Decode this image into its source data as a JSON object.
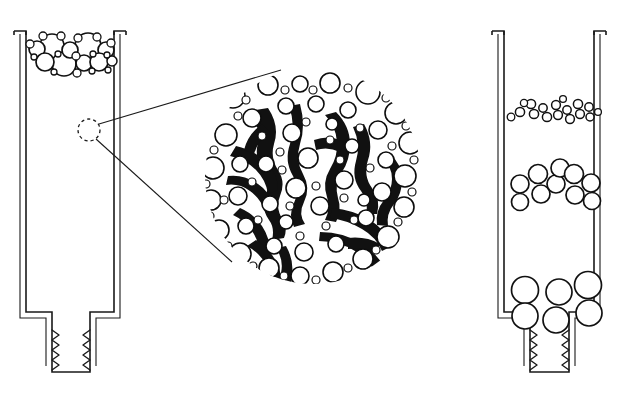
{
  "figure": {
    "background_color": "#ffffff",
    "ink_color": "#111111",
    "width": 621,
    "height": 410
  },
  "panels": [
    {
      "id": "left-tube",
      "name": "left-tube-panel",
      "label": "Left tube with dense mixed-size bubble layer at top",
      "tube": {
        "outer_left": 20,
        "outer_right": 120,
        "top": 30,
        "body_bottom": 312,
        "neck_left": 52,
        "neck_right": 90,
        "neck_bottom": 372,
        "wall_thickness": 6,
        "rim_flare": 9
      },
      "content_band": {
        "name": "mixed-bubble-band",
        "top": 34,
        "bottom": 74,
        "description": "Closely packed large and small circles spanning tube width"
      },
      "bubbles": [
        {
          "cx": 37,
          "cy": 49,
          "r": 8
        },
        {
          "cx": 52,
          "cy": 46,
          "r": 12
        },
        {
          "cx": 70,
          "cy": 50,
          "r": 8
        },
        {
          "cx": 88,
          "cy": 46,
          "r": 13
        },
        {
          "cx": 106,
          "cy": 50,
          "r": 8
        },
        {
          "cx": 45,
          "cy": 62,
          "r": 9
        },
        {
          "cx": 64,
          "cy": 64,
          "r": 12
        },
        {
          "cx": 84,
          "cy": 63,
          "r": 8
        },
        {
          "cx": 99,
          "cy": 62,
          "r": 9
        },
        {
          "cx": 112,
          "cy": 61,
          "r": 5
        },
        {
          "cx": 30,
          "cy": 44,
          "r": 4
        },
        {
          "cx": 43,
          "cy": 36,
          "r": 4
        },
        {
          "cx": 61,
          "cy": 36,
          "r": 4
        },
        {
          "cx": 78,
          "cy": 38,
          "r": 4
        },
        {
          "cx": 97,
          "cy": 37,
          "r": 4
        },
        {
          "cx": 111,
          "cy": 43,
          "r": 4
        },
        {
          "cx": 34,
          "cy": 57,
          "r": 3
        },
        {
          "cx": 58,
          "cy": 54,
          "r": 3
        },
        {
          "cx": 76,
          "cy": 56,
          "r": 4
        },
        {
          "cx": 93,
          "cy": 54,
          "r": 3
        },
        {
          "cx": 107,
          "cy": 55,
          "r": 3
        },
        {
          "cx": 54,
          "cy": 72,
          "r": 3
        },
        {
          "cx": 77,
          "cy": 73,
          "r": 4
        },
        {
          "cx": 92,
          "cy": 71,
          "r": 3
        },
        {
          "cx": 108,
          "cy": 70,
          "r": 3
        }
      ]
    },
    {
      "id": "right-tube",
      "name": "right-tube-panel",
      "label": "Right tube with three separated bubble bands of increasing size downward",
      "tube": {
        "outer_left": 498,
        "outer_right": 600,
        "top": 30,
        "body_bottom": 312,
        "neck_left": 530,
        "neck_right": 569,
        "neck_bottom": 372,
        "wall_thickness": 6,
        "rim_flare": 9
      },
      "bands": [
        {
          "name": "small-bubble-band",
          "top": 98,
          "bottom": 122,
          "size_label": "small",
          "radius": 4.5
        },
        {
          "name": "medium-bubble-band",
          "top": 166,
          "bottom": 204,
          "size_label": "medium",
          "radius": 9
        },
        {
          "name": "large-bubble-band",
          "top": 276,
          "bottom": 318,
          "size_label": "large",
          "radius": 13
        }
      ],
      "small_bubbles": [
        {
          "cx": 520,
          "cy": 112,
          "r": 4.6
        },
        {
          "cx": 531,
          "cy": 104,
          "r": 4.6
        },
        {
          "cx": 534,
          "cy": 114,
          "r": 4.6
        },
        {
          "cx": 543,
          "cy": 108,
          "r": 4.2
        },
        {
          "cx": 547,
          "cy": 117,
          "r": 4.6
        },
        {
          "cx": 556,
          "cy": 105,
          "r": 4.4
        },
        {
          "cx": 558,
          "cy": 115,
          "r": 4.4
        },
        {
          "cx": 567,
          "cy": 110,
          "r": 4.2
        },
        {
          "cx": 570,
          "cy": 119,
          "r": 4.4
        },
        {
          "cx": 578,
          "cy": 104,
          "r": 4.6
        },
        {
          "cx": 580,
          "cy": 114,
          "r": 4.4
        },
        {
          "cx": 589,
          "cy": 107,
          "r": 4.2
        },
        {
          "cx": 590,
          "cy": 117,
          "r": 4.0
        },
        {
          "cx": 511,
          "cy": 117,
          "r": 3.8
        },
        {
          "cx": 524,
          "cy": 103,
          "r": 3.6
        },
        {
          "cx": 563,
          "cy": 99,
          "r": 3.4
        },
        {
          "cx": 598,
          "cy": 112,
          "r": 3.4
        }
      ],
      "medium_bubbles": [
        {
          "cx": 520,
          "cy": 184,
          "r": 9
        },
        {
          "cx": 538,
          "cy": 174,
          "r": 9.5
        },
        {
          "cx": 541,
          "cy": 194,
          "r": 9
        },
        {
          "cx": 556,
          "cy": 184,
          "r": 9
        },
        {
          "cx": 560,
          "cy": 168,
          "r": 9
        },
        {
          "cx": 574,
          "cy": 174,
          "r": 9.5
        },
        {
          "cx": 575,
          "cy": 195,
          "r": 9
        },
        {
          "cx": 591,
          "cy": 183,
          "r": 9
        },
        {
          "cx": 520,
          "cy": 202,
          "r": 8.5
        },
        {
          "cx": 592,
          "cy": 201,
          "r": 8.5
        }
      ],
      "large_bubbles": [
        {
          "cx": 525,
          "cy": 290,
          "r": 13.5
        },
        {
          "cx": 559,
          "cy": 292,
          "r": 13
        },
        {
          "cx": 588,
          "cy": 285,
          "r": 13.5
        },
        {
          "cx": 525,
          "cy": 316,
          "r": 13
        },
        {
          "cx": 556,
          "cy": 320,
          "r": 13
        },
        {
          "cx": 589,
          "cy": 313,
          "r": 13
        }
      ]
    }
  ],
  "magnifier": {
    "name": "magnified-detail-circle",
    "label": "Magnified detail of foam microstructure: bubbles around dark dendritic glass network",
    "cx": 313,
    "cy": 176,
    "r": 108,
    "source_marker": {
      "name": "detail-source-marker",
      "label": "Dashed circle marking the magnified region on the left tube wall",
      "cx": 89,
      "cy": 130,
      "r": 11,
      "style": "dashed"
    },
    "callout_lines": [
      {
        "x1": 99,
        "y1": 124,
        "x2": 281,
        "y2": 70
      },
      {
        "x1": 96,
        "y1": 139,
        "x2": 232,
        "y2": 262
      }
    ]
  },
  "legend_text": [],
  "annotations": []
}
